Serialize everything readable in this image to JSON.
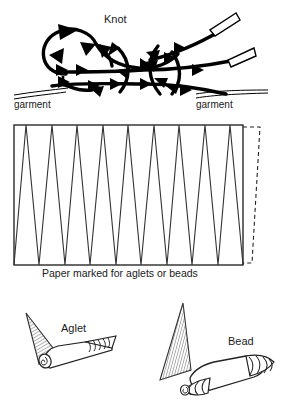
{
  "figure": {
    "background_color": "#ffffff",
    "ink_color": "#000000",
    "line_color": "#333333",
    "hatch_color": "#555555",
    "width": 283,
    "height": 410
  },
  "panels": {
    "knot_panel": {
      "label": "Knot",
      "garment_left_label": "garment",
      "garment_right_label": "garment"
    },
    "paper_panel": {
      "caption": "Paper marked for aglets or beads",
      "zigzag_peaks": 9,
      "box": {
        "x": 14,
        "y": 125,
        "width": 229,
        "height": 140
      },
      "dashed_flap": true
    },
    "parts_panel": {
      "aglet_label": "Aglet",
      "bead_label": "Bead"
    }
  }
}
